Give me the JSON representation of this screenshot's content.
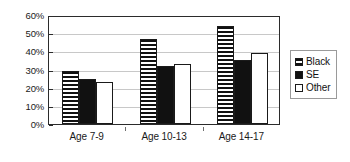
{
  "chart_data": {
    "type": "bar",
    "title": "",
    "subtitle": "",
    "xlabel": "",
    "ylabel": "",
    "categories": [
      "Age 7-9",
      "Age 10-13",
      "Age 14-17"
    ],
    "series": [
      {
        "name": "Black",
        "values": [
          29,
          47,
          54
        ],
        "fill": "horizontal-stripes"
      },
      {
        "name": "SE",
        "values": [
          25,
          32,
          35
        ],
        "fill": "solid-black"
      },
      {
        "name": "Other",
        "values": [
          23,
          33,
          39
        ],
        "fill": "white"
      }
    ],
    "ylim": [
      0,
      60
    ],
    "ytick_values": [
      0,
      10,
      20,
      30,
      40,
      50,
      60
    ],
    "ytick_labels": [
      "0%",
      "10%",
      "20%",
      "30%",
      "40%",
      "50%",
      "60%"
    ],
    "grid": true,
    "grid_axis": "y",
    "legend_position": "right",
    "value_suffix": "%"
  },
  "colors": {
    "axis": "#2b2b2b",
    "gridline": "#c8c8c8",
    "bar_outline": "#1a1a1a",
    "bar_solid": "#111111",
    "bar_empty": "#ffffff",
    "legend_border": "#9a9a9a",
    "background": "#ffffff",
    "text": "#111111"
  }
}
